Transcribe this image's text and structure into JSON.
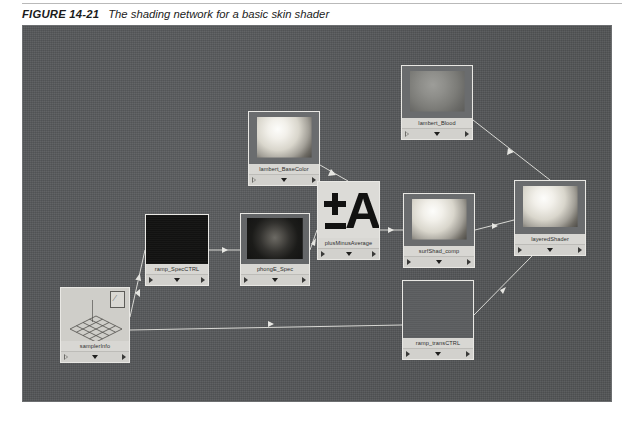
{
  "figure": {
    "label": "FIGURE 14-21",
    "caption": "The shading network for a basic skin shader"
  },
  "canvas": {
    "name": "hypershade-work-area",
    "background_color": "#56585a",
    "border_color": "#6d6f71"
  },
  "nodes": [
    {
      "id": "lambert-basecolor",
      "label": "lambert_BaseColor",
      "swatch": "sphere-bright",
      "x": 226,
      "y": 86,
      "w": 72,
      "h": 75
    },
    {
      "id": "lambert-blood",
      "label": "lambert_Blood",
      "swatch": "sphere-dim",
      "x": 379,
      "y": 40,
      "w": 72,
      "h": 75
    },
    {
      "id": "plusminusaverage",
      "label": "plusMinusAverage",
      "swatch": "pma-glyph",
      "x": 295,
      "y": 156,
      "w": 63,
      "h": 79
    },
    {
      "id": "surfshad-comp",
      "label": "surfShad_comp",
      "swatch": "sphere-bright",
      "x": 381,
      "y": 168,
      "w": 72,
      "h": 75
    },
    {
      "id": "layered-shader",
      "label": "layeredShader",
      "swatch": "sphere-bright",
      "x": 492,
      "y": 155,
      "w": 72,
      "h": 76
    },
    {
      "id": "ramp-specctrl",
      "label": "ramp_SpecCTRL",
      "swatch": "swatch-black",
      "x": 123,
      "y": 189,
      "w": 64,
      "h": 72
    },
    {
      "id": "phonge-spec",
      "label": "phongE_Spec",
      "swatch": "sphere-spec",
      "x": 218,
      "y": 188,
      "w": 70,
      "h": 73
    },
    {
      "id": "ramp-transctrl",
      "label": "ramp_transCTRL",
      "swatch": "swatch-gray",
      "x": 380,
      "y": 255,
      "w": 72,
      "h": 80
    },
    {
      "id": "sampler-info",
      "label": "samplerInfo",
      "swatch": "sampler-glyph",
      "x": 38,
      "y": 262,
      "w": 70,
      "h": 76
    }
  ],
  "node_controls": {
    "input_arrow": "triangle-left-outline-icon",
    "expand_arrow": "triangle-down-icon",
    "output_arrow": "triangle-right-icon"
  },
  "connections": [
    {
      "from": "samplerInfo",
      "to": "ramp_SpecCTRL"
    },
    {
      "from": "samplerInfo",
      "to": "ramp_transCTRL"
    },
    {
      "from": "ramp_SpecCTRL",
      "to": "phongE_Spec"
    },
    {
      "from": "phongE_Spec",
      "to": "plusMinusAverage"
    },
    {
      "from": "lambert_BaseColor",
      "to": "plusMinusAverage"
    },
    {
      "from": "plusMinusAverage",
      "to": "surfShad_comp"
    },
    {
      "from": "lambert_Blood",
      "to": "layeredShader"
    },
    {
      "from": "surfShad_comp",
      "to": "layeredShader"
    },
    {
      "from": "ramp_transCTRL",
      "to": "layeredShader"
    }
  ],
  "wire_color": "#d8d8d4"
}
